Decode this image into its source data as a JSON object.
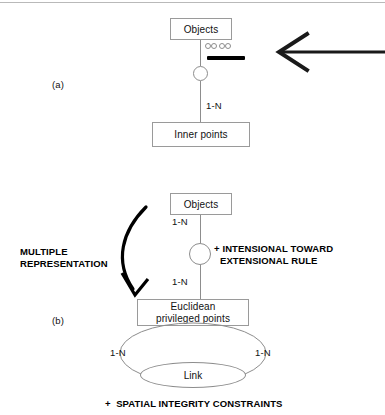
{
  "figure": {
    "type": "entity-relationship-diagram",
    "panels": [
      {
        "id": "a",
        "label": "(a)",
        "entities": [
          {
            "id": "objects-a",
            "label": "Objects"
          },
          {
            "id": "inner-points",
            "label": "Inner points"
          }
        ],
        "relationship_connector": "circle",
        "cardinality_labels": [
          "1-N"
        ],
        "annotation_marker": {
          "name": "selection-marker",
          "handles": 4,
          "bar_color": "#000000"
        },
        "pointer": {
          "name": "callout-arrow",
          "direction": "left",
          "color": "#1a1a1a"
        }
      },
      {
        "id": "b",
        "label": "(b)",
        "entities": [
          {
            "id": "objects-b",
            "label": "Objects"
          },
          {
            "id": "euclidean",
            "label": "Euclidean\nprivileged points"
          },
          {
            "id": "link",
            "label": "Link"
          }
        ],
        "relationship_connector": "circle",
        "cardinality_labels": [
          "1-N",
          "1-N",
          "1-N",
          "1-N"
        ],
        "notes": [
          {
            "id": "intensional-rule",
            "text": "+ INTENSIONAL TOWARD\n  EXTENSIONAL RULE"
          },
          {
            "id": "multiple-representation",
            "text": "MULTIPLE\nREPRESENTATION"
          }
        ],
        "transform_arrow": {
          "name": "multiple-representation-arrow",
          "direction": "curved-down-left",
          "color": "#000000"
        }
      }
    ],
    "footer_note": "+  SPATIAL INTEGRITY CONSTRAINTS"
  },
  "panel_a": {
    "tag": "(a)",
    "objects_label": "Objects",
    "inner_points_label": "Inner points",
    "cardinality": "1-N"
  },
  "panel_b": {
    "tag": "(b)",
    "objects_label": "Objects",
    "cardinality_top": "1-N",
    "cardinality_mid": "1-N",
    "rule_note_line1": "+ INTENSIONAL TOWARD",
    "rule_note_line2": "EXTENSIONAL RULE",
    "multiple_line1": "MULTIPLE",
    "multiple_line2": "REPRESENTATION",
    "euclidean_line1": "Euclidean",
    "euclidean_line2": "privileged points",
    "cardinality_left": "1-N",
    "cardinality_right": "1-N",
    "link_label": "Link"
  },
  "footer": {
    "note": "+  SPATIAL INTEGRITY CONSTRAINTS"
  },
  "colors": {
    "ink": "#111111",
    "box_border": "#9a9a9a",
    "line": "#8d8d8d",
    "marker": "#000000",
    "rule": "#b9b9b9"
  }
}
